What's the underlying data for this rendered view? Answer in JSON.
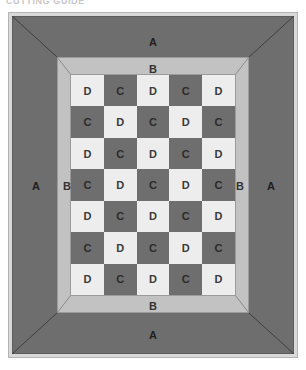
{
  "caption": {
    "text": "CUTTING GUIDE"
  },
  "diagram": {
    "colors": {
      "border_a_fill": "#6e6e6e",
      "border_b_fill": "#c2c2c2",
      "tile_light_fill": "#ededed",
      "tile_dark_fill": "#6e6e6e",
      "outer_frame_fill": "#d9d9d9",
      "outline": "#9b9b9b",
      "background": "#ffffff"
    },
    "borders": [
      {
        "code": "A",
        "name": "outer-border",
        "tone": "dark"
      },
      {
        "code": "B",
        "name": "inner-border",
        "tone": "light"
      }
    ],
    "border_labels": {
      "a_top": "A",
      "b_top": "B",
      "a_bottom": "A",
      "b_bottom": "B",
      "a_left": "A",
      "b_left": "B",
      "a_right": "A",
      "b_right": "B"
    },
    "grid": {
      "columns": 5,
      "rows": 7,
      "light_piece_code": "D",
      "dark_piece_code": "C",
      "cells": [
        [
          "D",
          "C",
          "D",
          "C",
          "D"
        ],
        [
          "C",
          "D",
          "C",
          "D",
          "C"
        ],
        [
          "D",
          "C",
          "D",
          "C",
          "D"
        ],
        [
          "C",
          "D",
          "C",
          "D",
          "C"
        ],
        [
          "D",
          "C",
          "D",
          "C",
          "D"
        ],
        [
          "C",
          "D",
          "C",
          "D",
          "C"
        ],
        [
          "D",
          "C",
          "D",
          "C",
          "D"
        ]
      ]
    }
  }
}
